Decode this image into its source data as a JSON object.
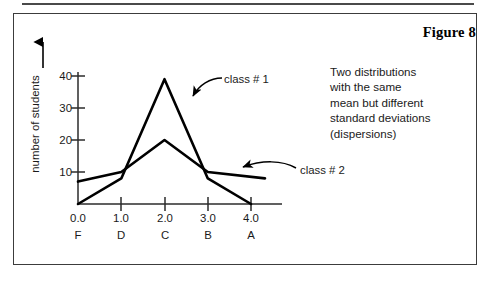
{
  "figure": {
    "title": "Figure 8",
    "note_lines": [
      "Two distributions",
      "with the same",
      "mean but different",
      "standard deviations",
      "(dispersions)"
    ]
  },
  "chart_data": {
    "type": "line",
    "title": "Figure 8",
    "xlabel": "",
    "ylabel": "number of students",
    "x": [
      0.0,
      1.0,
      2.0,
      3.0,
      4.0
    ],
    "categories": [
      "F",
      "D",
      "C",
      "B",
      "A"
    ],
    "xtick_labels": [
      "0.0",
      "1.0",
      "2.0",
      "3.0",
      "4.0"
    ],
    "ytick_labels": [
      "10",
      "20",
      "30",
      "40"
    ],
    "yticks": [
      10,
      20,
      30,
      40
    ],
    "ylim": [
      0,
      44
    ],
    "xlim": [
      0.0,
      4.0
    ],
    "grid": false,
    "legend_position": "inline-callout",
    "series": [
      {
        "name": "class # 1",
        "values": [
          0,
          8,
          39,
          8,
          0
        ],
        "color": "#000000"
      },
      {
        "name": "class # 2",
        "values": [
          7,
          10,
          20,
          10,
          5
        ],
        "color": "#000000"
      }
    ],
    "annotations": [
      "class # 1",
      "class # 2",
      "Two distributions with the same mean but different standard deviations (dispersions)"
    ]
  },
  "colors": {
    "line": "#000000",
    "axis": "#2b2b2b",
    "frame": "#3c3c3c",
    "text": "#1a1a1a"
  }
}
